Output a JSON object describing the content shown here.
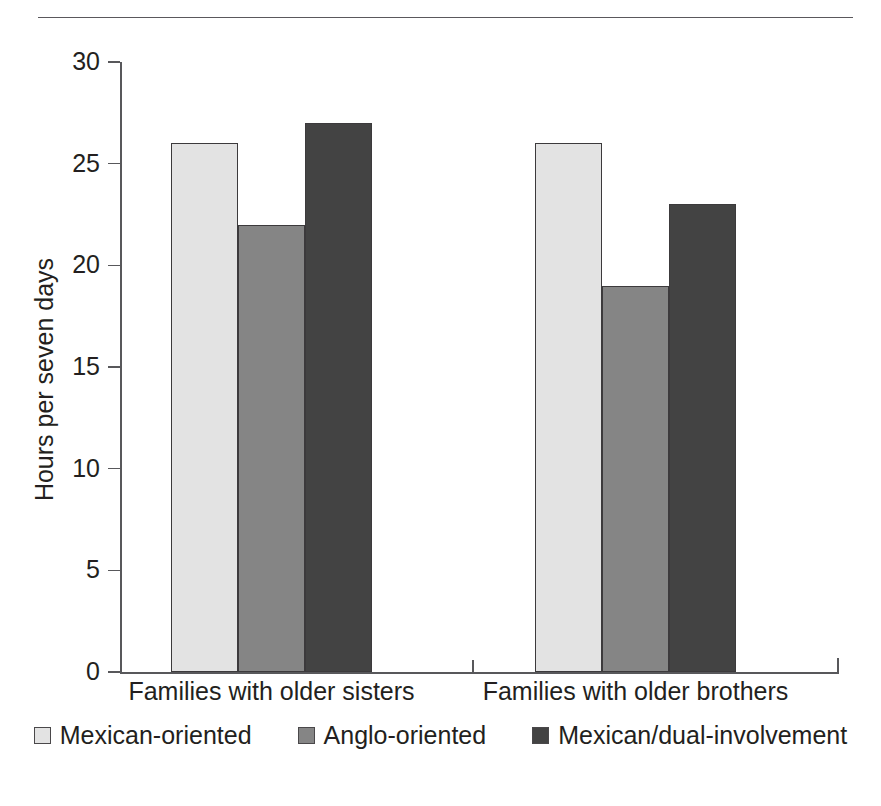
{
  "chart_data": {
    "type": "bar",
    "title": "",
    "subtitle": "",
    "xlabel": "",
    "ylabel": "Hours per seven days",
    "ylim": [
      0,
      30
    ],
    "ytick_values": [
      0,
      5,
      10,
      15,
      20,
      25,
      30
    ],
    "ytick_labels": [
      "0",
      "5",
      "10",
      "15",
      "20",
      "25",
      "30"
    ],
    "grid": false,
    "legend_position": "bottom",
    "categories": [
      "Families with older sisters",
      "Families with older brothers"
    ],
    "series": [
      {
        "name": "Mexican-oriented",
        "color": "#e3e3e3",
        "values": [
          26,
          26
        ]
      },
      {
        "name": "Anglo-oriented",
        "color": "#858585",
        "values": [
          22,
          19
        ]
      },
      {
        "name": "Mexican/dual-involvement",
        "color": "#434343",
        "values": [
          27,
          23
        ]
      }
    ]
  },
  "axis": {
    "line_color": "#58585b"
  },
  "decor": {
    "top_rule_color": "#5a585c"
  }
}
